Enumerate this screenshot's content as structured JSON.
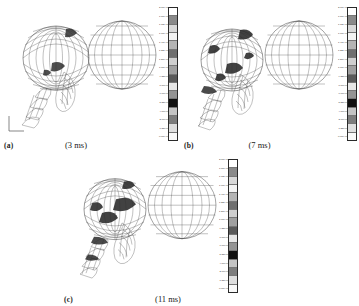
{
  "figure": {
    "panels": [
      {
        "letter": "(a)",
        "time": "(3 ms)",
        "name": "panel-a",
        "legend_title": "Fringe Levels"
      },
      {
        "letter": "(b)",
        "time": "(7 ms)",
        "name": "panel-b",
        "legend_title": "Fringe Levels"
      },
      {
        "letter": "(c)",
        "time": "(11 ms)",
        "name": "panel-c",
        "legend_title": "Fringe Levels"
      }
    ]
  },
  "legend": {
    "ticks": [
      "2.00e+00",
      "1.87e+00",
      "1.73e+00",
      "1.60e+00",
      "1.47e+00",
      "1.33e+00",
      "1.20e+00",
      "1.07e+00",
      "9.33e-01",
      "8.00e-01",
      "6.67e-01",
      "5.33e-01",
      "4.00e-01",
      "2.67e-01",
      "1.33e-01",
      "0.00e+00"
    ],
    "colors": [
      "#ffffff",
      "#8a8a8a",
      "#d8d8d8",
      "#f2f2f2",
      "#b4b4b4",
      "#6f6f6f",
      "#cfcfcf",
      "#a0a0a0",
      "#5a5a5a",
      "#e6e6e6",
      "#949494",
      "#101010",
      "#c4c4c4",
      "#7d7d7d",
      "#dedede",
      "#f8f8f8"
    ]
  },
  "axes": {
    "x_label": "x",
    "y_label": "z"
  },
  "colors": {
    "mesh_line": "#3a3a3a",
    "sphere_line": "#4a4a4a",
    "background": "#ffffff",
    "text": "#1a1a1a"
  }
}
